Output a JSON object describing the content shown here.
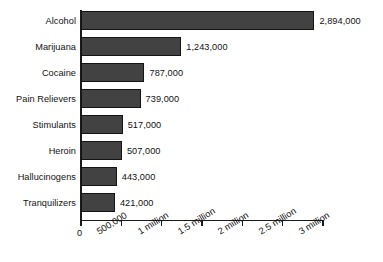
{
  "chart_data": {
    "type": "bar",
    "orientation": "horizontal",
    "title": "",
    "subtitle": "",
    "xlabel": "",
    "ylabel": "",
    "categories": [
      "Alcohol",
      "Marijuana",
      "Cocaine",
      "Pain Relievers",
      "Stimulants",
      "Heroin",
      "Hallucinogens",
      "Tranquilizers"
    ],
    "values": [
      2894000,
      1243000,
      787000,
      739000,
      517000,
      507000,
      443000,
      421000
    ],
    "value_labels": [
      "2,894,000",
      "1,243,000",
      "787,000",
      "739,000",
      "517,000",
      "507,000",
      "443,000",
      "421,000"
    ],
    "xlim": [
      0,
      3000000
    ],
    "xticks": [
      0,
      500000,
      1000000,
      1500000,
      2000000,
      2500000,
      3000000
    ],
    "xtick_labels": [
      "0",
      "500,000",
      "1 million",
      "1.5 million",
      "2 million",
      "2.5 million",
      "3 million"
    ],
    "grid": false,
    "legend": null,
    "legend_position": "none",
    "bar_color": "#424242",
    "bar_edge_color": "#141414",
    "axis_color": "#1a1a1a",
    "background_color": "#ffffff",
    "text_color": "#111111",
    "annotations": []
  }
}
